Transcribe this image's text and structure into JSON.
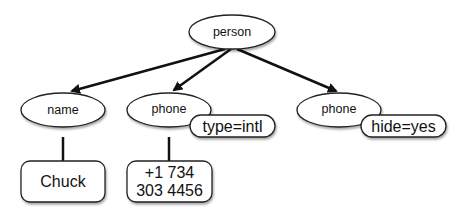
{
  "diagram": {
    "type": "tree",
    "nodes": {
      "root": {
        "label": "person",
        "shape": "ellipse"
      },
      "name": {
        "label": "name",
        "shape": "ellipse"
      },
      "phone1": {
        "label": "phone",
        "shape": "ellipse"
      },
      "phone1_attr": {
        "label": "type=intl",
        "shape": "pill"
      },
      "phone2": {
        "label": "phone",
        "shape": "ellipse"
      },
      "phone2_attr": {
        "label": "hide=yes",
        "shape": "pill"
      },
      "name_value": {
        "label": "Chuck",
        "shape": "rounded-box"
      },
      "phone1_value": {
        "line1": "+1 734",
        "line2": "303 4456",
        "shape": "rounded-box"
      }
    },
    "edges": [
      {
        "from": "person",
        "to": "name"
      },
      {
        "from": "person",
        "to": "phone"
      },
      {
        "from": "person",
        "to": "phone (hide=yes)"
      },
      {
        "from": "name",
        "to": "Chuck"
      },
      {
        "from": "phone (type=intl)",
        "to": "+1 734 303 4456"
      }
    ]
  }
}
